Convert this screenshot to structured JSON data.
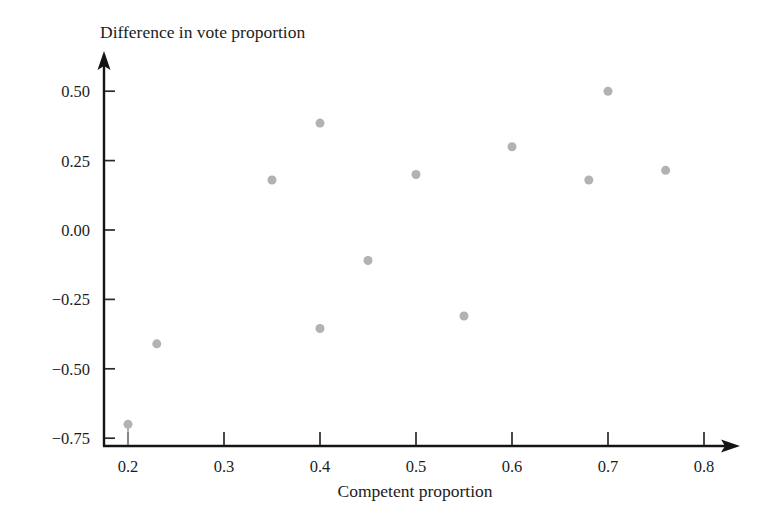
{
  "figure": {
    "width": 778,
    "height": 522,
    "background_color": "#ffffff"
  },
  "chart_data": {
    "type": "scatter",
    "title": "",
    "xlabel": "Competent proportion",
    "ylabel": "Difference in vote proportion",
    "xlim": [
      0.17,
      0.83
    ],
    "ylim": [
      -0.78,
      0.58
    ],
    "xticks": [
      0.2,
      0.3,
      0.4,
      0.5,
      0.6,
      0.7,
      0.8
    ],
    "xtick_labels": [
      "0.2",
      "0.3",
      "0.4",
      "0.5",
      "0.6",
      "0.7",
      "0.8"
    ],
    "yticks": [
      0.5,
      0.25,
      0.0,
      -0.25,
      -0.5,
      -0.75
    ],
    "ytick_labels": [
      "0.50",
      "0.25",
      "0.00",
      "−0.25",
      "−0.50",
      "−0.75"
    ],
    "grid": false,
    "legend": null,
    "marker_color": "#b2b2b2",
    "marker_size": 9,
    "axis_style": "arrow-tipped L-axes, ticks outward",
    "x": [
      0.2,
      0.23,
      0.35,
      0.4,
      0.4,
      0.45,
      0.5,
      0.55,
      0.6,
      0.68,
      0.7,
      0.76
    ],
    "y": [
      -0.7,
      -0.41,
      0.18,
      0.385,
      -0.355,
      -0.11,
      0.2,
      -0.31,
      0.3,
      0.18,
      0.5,
      0.215
    ],
    "points": [
      {
        "x": 0.2,
        "y": -0.7,
        "stem": true
      },
      {
        "x": 0.23,
        "y": -0.41,
        "stem": false
      },
      {
        "x": 0.35,
        "y": 0.18,
        "stem": false
      },
      {
        "x": 0.4,
        "y": 0.385,
        "stem": false
      },
      {
        "x": 0.4,
        "y": -0.355,
        "stem": false
      },
      {
        "x": 0.45,
        "y": -0.11,
        "stem": false
      },
      {
        "x": 0.5,
        "y": 0.2,
        "stem": false
      },
      {
        "x": 0.55,
        "y": -0.31,
        "stem": false
      },
      {
        "x": 0.6,
        "y": 0.3,
        "stem": false
      },
      {
        "x": 0.68,
        "y": 0.18,
        "stem": false
      },
      {
        "x": 0.7,
        "y": 0.5,
        "stem": false
      },
      {
        "x": 0.76,
        "y": 0.215,
        "stem": false
      }
    ]
  },
  "axes_geometry": {
    "y_axis_x": 104,
    "x_axis_y": 446,
    "y_axis_top": 53,
    "x_axis_right": 738,
    "x_scale_px_per_0_1": 96,
    "x_origin_value": 0.2,
    "x_origin_px": 128,
    "y_scale_px_per_0_25": 69.4,
    "y_origin_value": 0.0,
    "y_origin_px": 230,
    "tick_length": 11
  },
  "labels": {
    "ylabel_x": 100,
    "ylabel_y": 38,
    "xlabel_x": 415,
    "xlabel_y": 495
  }
}
